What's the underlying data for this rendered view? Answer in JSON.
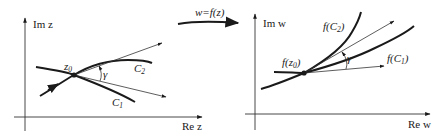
{
  "diagram": {
    "mapping_label": "w=f(z)",
    "colors": {
      "ink": "#1a1a1a",
      "thin": "#333333",
      "background": "#ffffff"
    },
    "z_plane": {
      "y_axis_label": "Im z",
      "x_axis_label": "Re z",
      "point_label": "z",
      "point_sub": "0",
      "curve1_label": "C",
      "curve1_sub": "1",
      "curve2_label": "C",
      "curve2_sub": "2",
      "angle_label": "γ"
    },
    "w_plane": {
      "y_axis_label": "Im w",
      "x_axis_label": "Re w",
      "point_label_pre": "f(z",
      "point_sub": "0",
      "point_label_post": ")",
      "curve1_label_pre": "f(C",
      "curve1_sub": "1",
      "curve1_label_post": ")",
      "curve2_label_pre": "f(C",
      "curve2_sub": "2",
      "curve2_label_post": ")",
      "angle_label": "γ"
    }
  }
}
